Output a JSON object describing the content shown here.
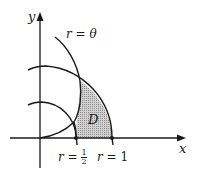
{
  "diagram": {
    "type": "polar-region",
    "axes": {
      "x_label": "x",
      "y_label": "y"
    },
    "curves": [
      {
        "name": "spiral",
        "label_r": "r",
        "label_eq": "=",
        "label_rhs": "θ"
      },
      {
        "name": "circle-half",
        "equation": "r = 1/2"
      },
      {
        "name": "circle-one",
        "equation": "r = 1"
      }
    ],
    "region": {
      "label": "D",
      "fill": "#b8b8b8"
    },
    "markers": [
      {
        "label_r": "r",
        "label_eq": "=",
        "num": "1",
        "den": "2"
      },
      {
        "label_r": "r",
        "label_eq": "=",
        "value": "1"
      }
    ],
    "colors": {
      "stroke": "#1a1a1a",
      "region_fill": "#bdbdbd",
      "background": "#ffffff"
    }
  }
}
